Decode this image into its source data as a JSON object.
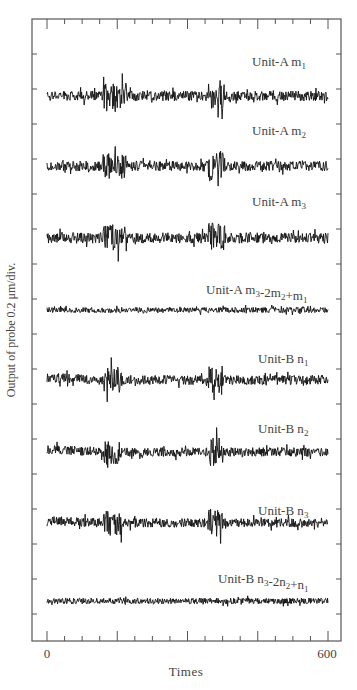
{
  "chart_data": {
    "type": "line",
    "title": "",
    "xlabel": "Times",
    "ylabel": "Output of probe 0.2 μm/div.",
    "xlim": [
      0,
      600
    ],
    "x_tick_labels": [
      "0",
      "600"
    ],
    "x_major_ticks": [
      0,
      150,
      300,
      450,
      600
    ],
    "x_minor_step": 37.5,
    "grid": false,
    "legend": "none (inline trace labels)",
    "series": [
      {
        "name": "Unit-A m1",
        "label_main": "Unit-A m",
        "sub": "1",
        "baseline_px": 96,
        "amplitude": 1.0,
        "bursts": [
          [
            120,
            170,
            2.6
          ],
          [
            345,
            380,
            3.0
          ]
        ]
      },
      {
        "name": "Unit-A m2",
        "label_main": "Unit-A m",
        "sub": "2",
        "baseline_px": 166,
        "amplitude": 1.0,
        "bursts": [
          [
            120,
            170,
            2.6
          ],
          [
            345,
            380,
            3.0
          ]
        ]
      },
      {
        "name": "Unit-A m3",
        "label_main": "Unit-A m",
        "sub": "3",
        "baseline_px": 238,
        "amplitude": 1.05,
        "bursts": [
          [
            120,
            170,
            2.6
          ],
          [
            345,
            380,
            3.0
          ]
        ]
      },
      {
        "name": "Unit-A m3-2m2+m1",
        "label_html": "Unit-A m<sub>3</sub>-2m<sub>2</sub>+m<sub>1</sub>",
        "baseline_px": 310,
        "amplitude": 0.55,
        "bursts": []
      },
      {
        "name": "Unit-B n1",
        "label_main": "Unit-B n",
        "sub": "1",
        "baseline_px": 380,
        "amplitude": 0.95,
        "bursts": [
          [
            120,
            160,
            2.8
          ],
          [
            345,
            375,
            3.2
          ]
        ],
        "drift": 0.5
      },
      {
        "name": "Unit-B n2",
        "label_main": "Unit-B n",
        "sub": "2",
        "baseline_px": 452,
        "amplitude": 0.9,
        "bursts": [
          [
            120,
            160,
            2.8
          ],
          [
            345,
            375,
            3.2
          ]
        ],
        "drift": 0.5
      },
      {
        "name": "Unit-B n3",
        "label_main": "Unit-B n",
        "sub": "3",
        "baseline_px": 523,
        "amplitude": 0.9,
        "bursts": [
          [
            120,
            160,
            2.8
          ],
          [
            345,
            375,
            3.2
          ]
        ],
        "drift": 0.5
      },
      {
        "name": "Unit-B n3-2n2+n1",
        "label_html": "Unit-B n<sub>3</sub>-2n<sub>2</sub>+n<sub>1</sub>",
        "baseline_px": 601,
        "amplitude": 0.6,
        "bursts": []
      }
    ],
    "trace_labels": [
      {
        "text": "Unit-A m",
        "sub": "1",
        "x": 252,
        "y": 66
      },
      {
        "text": "Unit-A m",
        "sub": "2",
        "x": 252,
        "y": 135
      },
      {
        "text": "Unit-A m",
        "sub": "3",
        "x": 252,
        "y": 206
      },
      {
        "text": "Unit-A m",
        "sub": "3",
        "text2": "-2m",
        "sub2": "2",
        "text3": "+m",
        "sub3": "1",
        "x": 206,
        "y": 294
      },
      {
        "text": "Unit-B n",
        "sub": "1",
        "x": 258,
        "y": 363
      },
      {
        "text": "Unit-B n",
        "sub": "2",
        "x": 258,
        "y": 433
      },
      {
        "text": "Unit-B n",
        "sub": "3",
        "x": 258,
        "y": 515
      },
      {
        "text": "Unit-B n",
        "sub": "3",
        "text2": "-2n",
        "sub2": "2",
        "text3": "+n",
        "sub3": "1",
        "x": 218,
        "y": 583
      }
    ]
  },
  "axes": {
    "x_label": "Times",
    "y_label": "Output of probe 0.2 μm/div.",
    "x_tick_0": "0",
    "x_tick_600": "600"
  }
}
